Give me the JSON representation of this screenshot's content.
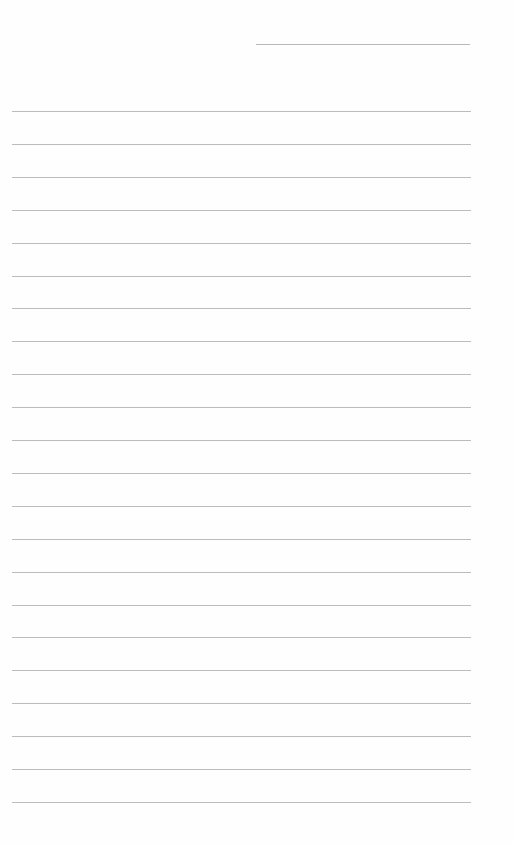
{
  "page": {
    "type": "blank-lined-sheet",
    "background_color": "#ffffff",
    "line_color": "#bcbcbc",
    "header_line": {
      "present": true,
      "text": ""
    },
    "ruled_lines": {
      "count": 22,
      "first_y": 111,
      "spacing": 32.9,
      "lines": [
        "",
        "",
        "",
        "",
        "",
        "",
        "",
        "",
        "",
        "",
        "",
        "",
        "",
        "",
        "",
        "",
        "",
        "",
        "",
        "",
        "",
        ""
      ]
    }
  }
}
